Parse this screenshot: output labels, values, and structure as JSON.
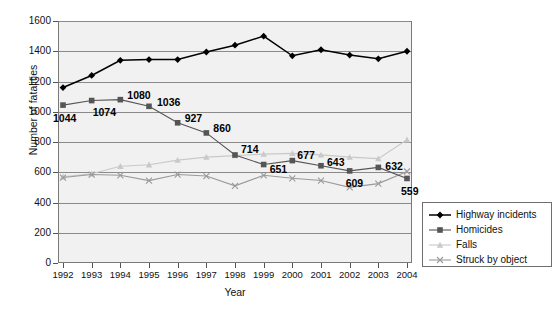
{
  "chart_data": {
    "type": "line",
    "title": "",
    "xlabel": "Year",
    "ylabel": "Number of fatalities",
    "categories": [
      "1992",
      "1993",
      "1994",
      "1995",
      "1996",
      "1997",
      "1998",
      "1999",
      "2000",
      "2001",
      "2002",
      "2003",
      "2004"
    ],
    "ylim": [
      0,
      1600
    ],
    "ytick_step": 200,
    "yticks": [
      "0",
      "200",
      "400",
      "600",
      "800",
      "1000",
      "1200",
      "1400",
      "1600"
    ],
    "grid": true,
    "legend_position": "right",
    "series": [
      {
        "name": "Highway incidents",
        "marker": "diamond",
        "color": "#000000",
        "values": [
          1160,
          1240,
          1340,
          1345,
          1345,
          1395,
          1440,
          1500,
          1370,
          1410,
          1375,
          1350,
          1400
        ],
        "labels": [
          "",
          "",
          "",
          "",
          "",
          "",
          "",
          "",
          "",
          "",
          "",
          "",
          ""
        ]
      },
      {
        "name": "Homicides",
        "marker": "square",
        "color": "#555555",
        "values": [
          1044,
          1074,
          1080,
          1036,
          927,
          860,
          714,
          651,
          677,
          643,
          609,
          632,
          559
        ],
        "labels": [
          "1044",
          "1074",
          "1080",
          "1036",
          "927",
          "860",
          "714",
          "651",
          "677",
          "643",
          "609",
          "632",
          "559"
        ]
      },
      {
        "name": "Falls",
        "marker": "triangle",
        "color": "#c9c9c9",
        "values": [
          570,
          590,
          640,
          650,
          680,
          700,
          710,
          720,
          725,
          715,
          700,
          690,
          815
        ],
        "labels": [
          "",
          "",
          "",
          "",
          "",
          "",
          "",
          "",
          "",
          "",
          "",
          "",
          ""
        ]
      },
      {
        "name": "Struck by object",
        "marker": "cross",
        "color": "#9a9a9a",
        "values": [
          565,
          585,
          580,
          545,
          585,
          575,
          510,
          580,
          560,
          545,
          500,
          525,
          605
        ],
        "labels": [
          "",
          "",
          "",
          "",
          "",
          "",
          "",
          "",
          "",
          "",
          "",
          "",
          ""
        ]
      }
    ]
  },
  "legend": {
    "items": [
      {
        "label": "Highway incidents"
      },
      {
        "label": "Homicides"
      },
      {
        "label": "Falls"
      },
      {
        "label": "Struck by object"
      }
    ]
  }
}
